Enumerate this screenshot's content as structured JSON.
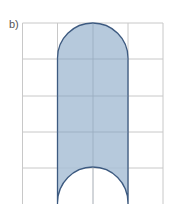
{
  "figure": {
    "label": "b)",
    "grid": {
      "columns": 4,
      "rows": 5,
      "line_color": "#c8c8c8"
    },
    "shape": {
      "description": "Rectangle two units wide with a semicircular cap on top and a semicircular cut-out at the bottom",
      "fill_color": "#a9bfd6",
      "stroke_color": "#3d5a80"
    }
  }
}
